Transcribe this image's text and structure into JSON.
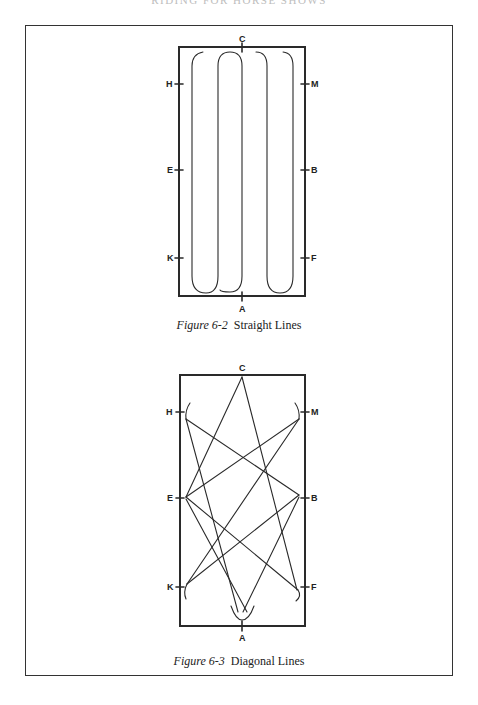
{
  "page": {
    "running_head": "RIDING FOR HORSE SHOWS"
  },
  "figures": [
    {
      "id": "figure-6-2",
      "caption_number": "Figure 6-2",
      "caption_title": "Straight Lines",
      "markers": {
        "top": "C",
        "bottom": "A",
        "left": [
          "H",
          "E",
          "K"
        ],
        "right": [
          "M",
          "B",
          "F"
        ]
      }
    },
    {
      "id": "figure-6-3",
      "caption_number": "Figure 6-3",
      "caption_title": "Diagonal Lines",
      "markers": {
        "top": "C",
        "bottom": "A",
        "left": [
          "H",
          "E",
          "K"
        ],
        "right": [
          "M",
          "B",
          "F"
        ]
      }
    }
  ]
}
